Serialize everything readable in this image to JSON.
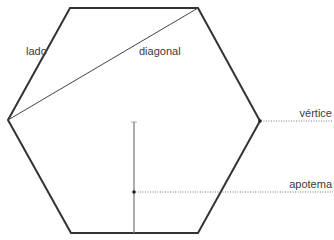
{
  "diagram": {
    "type": "regular-hexagon",
    "colors": {
      "outline": "#333333",
      "diagonal": "#444444",
      "apothem": "#777777",
      "leader": "#555555",
      "text": "#3a3a3a"
    },
    "vertices": [
      [
        70,
        8
      ],
      [
        198,
        8
      ],
      [
        260,
        121
      ],
      [
        198,
        233
      ],
      [
        71,
        233
      ],
      [
        8,
        120
      ]
    ],
    "labels": {
      "side": "lado",
      "diagonal": "diagonal",
      "vertex": "vértice",
      "apothem": "apotema"
    }
  }
}
